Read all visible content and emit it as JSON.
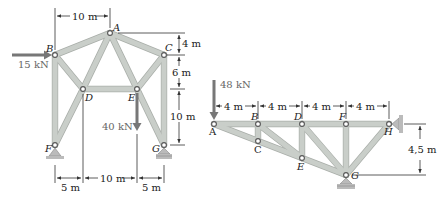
{
  "figure": "Two planar truss diagrams",
  "truss_left": {
    "nodes": {
      "A": {
        "label": "A",
        "x": 110,
        "y": 33
      },
      "B": {
        "label": "B",
        "x": 55,
        "y": 55
      },
      "C": {
        "label": "C",
        "x": 164,
        "y": 55
      },
      "D": {
        "label": "D",
        "x": 83,
        "y": 89
      },
      "E": {
        "label": "E",
        "x": 137,
        "y": 89
      },
      "F": {
        "label": "F",
        "x": 55,
        "y": 145
      },
      "G": {
        "label": "G",
        "x": 164,
        "y": 145
      }
    },
    "members": [
      [
        "A",
        "B"
      ],
      [
        "A",
        "C"
      ],
      [
        "A",
        "D"
      ],
      [
        "A",
        "E"
      ],
      [
        "B",
        "D"
      ],
      [
        "B",
        "F"
      ],
      [
        "C",
        "E"
      ],
      [
        "C",
        "G"
      ],
      [
        "D",
        "E"
      ],
      [
        "D",
        "F"
      ],
      [
        "E",
        "G"
      ]
    ],
    "loads": {
      "horizontal": {
        "label": "15 kN",
        "at": "B"
      },
      "vertical": {
        "label": "40 kN",
        "at": "E"
      }
    },
    "dimensions": {
      "top_horizontal": "10 m",
      "right_upper": "4 m",
      "right_middle": "6 m",
      "right_lower": "10 m",
      "bottom_left": "5 m",
      "bottom_middle": "10 m",
      "bottom_right": "5 m"
    },
    "supports": [
      "F",
      "G"
    ]
  },
  "truss_right": {
    "nodes": {
      "A": {
        "label": "A",
        "x": 214,
        "y": 124
      },
      "B": {
        "label": "B",
        "x": 258,
        "y": 124
      },
      "C": {
        "label": "C",
        "x": 258,
        "y": 141
      },
      "D": {
        "label": "D",
        "x": 302,
        "y": 124
      },
      "E": {
        "label": "E",
        "x": 302,
        "y": 158
      },
      "F": {
        "label": "F",
        "x": 346,
        "y": 124
      },
      "G": {
        "label": "G",
        "x": 346,
        "y": 175
      },
      "H": {
        "label": "H",
        "x": 389,
        "y": 124
      }
    },
    "members": [
      [
        "A",
        "B"
      ],
      [
        "B",
        "D"
      ],
      [
        "D",
        "F"
      ],
      [
        "F",
        "H"
      ],
      [
        "A",
        "C"
      ],
      [
        "C",
        "E"
      ],
      [
        "E",
        "G"
      ],
      [
        "B",
        "C"
      ],
      [
        "B",
        "E"
      ],
      [
        "D",
        "E"
      ],
      [
        "D",
        "G"
      ],
      [
        "F",
        "G"
      ],
      [
        "H",
        "G"
      ]
    ],
    "loads": {
      "vertical": {
        "label": "48 kN",
        "at": "A"
      }
    },
    "dimensions": {
      "panels": [
        "4 m",
        "4 m",
        "4 m",
        "4 m"
      ],
      "height": "4,5 m"
    },
    "supports": [
      "G",
      "H"
    ]
  }
}
